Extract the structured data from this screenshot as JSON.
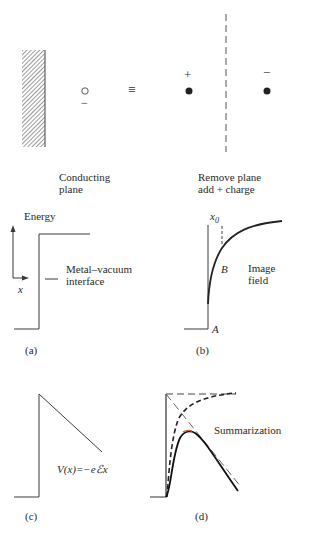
{
  "top": {
    "conducting_label_line1": "Conducting",
    "conducting_label_line2": "plane",
    "equivalent_symbol": "≡",
    "electron_charge": "−",
    "positive_charge": "+",
    "negative_charge": "−",
    "remove_label_line1": "Remove plane",
    "remove_label_line2": "add + charge"
  },
  "panel_a": {
    "axis_label": "Energy",
    "x_label": "x",
    "interface_line1": "Metal–vacuum",
    "interface_line2": "interface",
    "caption": "(a)"
  },
  "panel_b": {
    "x0_label": "x",
    "x0_sub": "0",
    "point_b": "B",
    "point_a": "A",
    "field_line1": "Image",
    "field_line2": "field",
    "caption": "(b)"
  },
  "panel_c": {
    "formula": "V(x)=−eℰx",
    "caption": "(c)"
  },
  "panel_d": {
    "label": "Summarization",
    "caption": "(d)"
  },
  "colors": {
    "line": "#3a3a3a",
    "hatch": "#555555",
    "peak_highlight": "#d9603a"
  }
}
